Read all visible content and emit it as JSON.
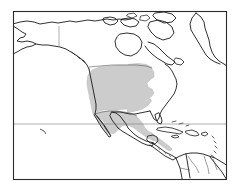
{
  "figure": {
    "kind": "range-map",
    "region_title": "North America",
    "background_color": "#ffffff",
    "frame": {
      "color": "#2b2b2b",
      "line_width": 1.1,
      "x": 13,
      "y": 11,
      "width": 214,
      "height": 169
    },
    "coastline": {
      "color": "#1a1a1a",
      "line_width": 0.9,
      "fill": "#ffffff"
    },
    "internal_borders": {
      "color": "#5a5a5a",
      "line_width": 0.6
    },
    "range_shading": {
      "label": "shaded distribution range",
      "fill_color": "#cccccc",
      "edge_color": "#bdbdbd",
      "covers": [
        "central United States",
        "western United States",
        "Great Plains",
        "Mexico",
        "Central America"
      ]
    },
    "graticule": {
      "color": "#7a7a7a",
      "line_width": 0.6,
      "horizontal_lines": [
        124
      ],
      "vertical_lines": [
        {
          "x": 59,
          "y1": 26,
          "y2": 47,
          "label": "alaska-yukon-border"
        }
      ]
    },
    "landmasses": [
      "Alaska",
      "Canada",
      "Canadian Arctic Archipelago",
      "Greenland",
      "Hudson Bay",
      "United States",
      "Mexico",
      "Central America",
      "Cuba",
      "Hispaniola",
      "Lesser Antilles",
      "Northern South America"
    ]
  },
  "chart_data": {
    "type": "map",
    "title": "",
    "xlabel": "",
    "ylabel": "",
    "grid": true,
    "legend": "none",
    "projection_box": [
      13,
      11,
      227,
      180
    ],
    "series": [
      {
        "name": "shaded range",
        "color": "#cccccc",
        "values": []
      }
    ]
  }
}
